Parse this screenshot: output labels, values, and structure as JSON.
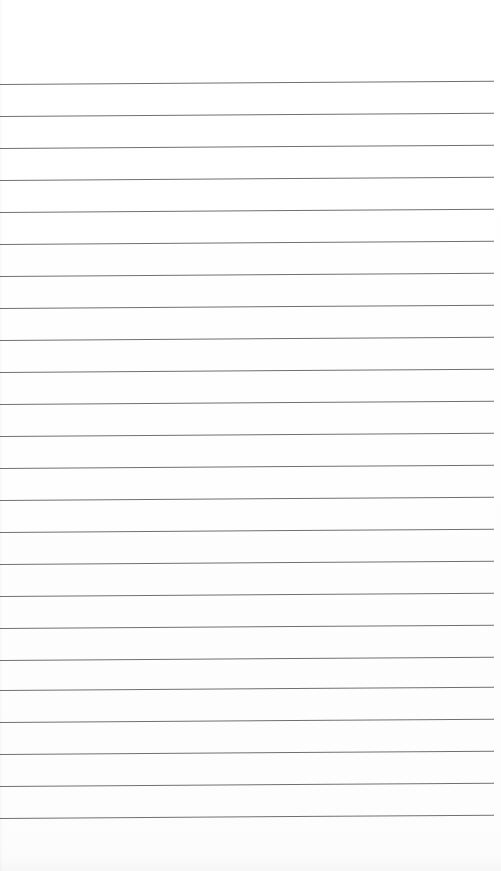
{
  "document": {
    "kind": "scanned-ruled-notepad-page",
    "title": "Blank Ruled Notepad Page",
    "width": 501,
    "height": 871,
    "background_color": "#ffffff",
    "content_text": "",
    "has_handwriting": false,
    "has_printed_text": false
  },
  "paper": {
    "color": "#ffffff",
    "tint_color": "#fdfdfd",
    "top_margin_px": 84,
    "bottom_margin_px": 53,
    "left_edge_x": 0,
    "right_edge_x": 501
  },
  "rules": {
    "label": "horizontal ruled lines",
    "count": 24,
    "color": "#707070",
    "thickness_px": 1,
    "spacing_px": 31.9,
    "first_line_y": 84,
    "last_line_y": 818,
    "line_start_x": 0,
    "line_end_x": 494,
    "skew_deg": -0.38,
    "lines": [
      {
        "index": 1,
        "y": 84
      },
      {
        "index": 2,
        "y": 116
      },
      {
        "index": 3,
        "y": 148
      },
      {
        "index": 4,
        "y": 180
      },
      {
        "index": 5,
        "y": 212
      },
      {
        "index": 6,
        "y": 244
      },
      {
        "index": 7,
        "y": 276
      },
      {
        "index": 8,
        "y": 308
      },
      {
        "index": 9,
        "y": 340
      },
      {
        "index": 10,
        "y": 372
      },
      {
        "index": 11,
        "y": 404
      },
      {
        "index": 12,
        "y": 436
      },
      {
        "index": 13,
        "y": 468
      },
      {
        "index": 14,
        "y": 500
      },
      {
        "index": 15,
        "y": 532
      },
      {
        "index": 16,
        "y": 564
      },
      {
        "index": 17,
        "y": 596
      },
      {
        "index": 18,
        "y": 628
      },
      {
        "index": 19,
        "y": 660
      },
      {
        "index": 20,
        "y": 690
      },
      {
        "index": 21,
        "y": 722
      },
      {
        "index": 22,
        "y": 754
      },
      {
        "index": 23,
        "y": 786
      },
      {
        "index": 24,
        "y": 818
      }
    ]
  }
}
